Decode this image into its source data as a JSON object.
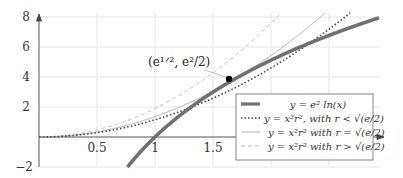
{
  "chart_data": {
    "type": "line",
    "title": "",
    "xlabel": "",
    "ylabel": "",
    "xlim": [
      0,
      2.95
    ],
    "ylim": [
      -2,
      8
    ],
    "grid": true,
    "x_ticks": [
      "0.5",
      "1",
      "1.5"
    ],
    "y_ticks": [
      "-2",
      "2",
      "4",
      "6",
      "8"
    ],
    "legend_position": "lower right",
    "series": [
      {
        "name": "y = e^2 ln(x)",
        "style": "thick solid",
        "color": "#707070",
        "formula": "e^2*ln(x)"
      },
      {
        "name": "y = x^2 r^2, with r < sqrt(e/2)",
        "style": "dotted",
        "color": "#444444",
        "r_squared": 1.15
      },
      {
        "name": "y = x^2 r^2 with r = sqrt(e/2)",
        "style": "thin solid",
        "color": "#9a9a9a",
        "r_squared": 1.3591
      },
      {
        "name": "y = x^2 r^2 with r > sqrt(e/2)",
        "style": "dashed",
        "color": "#a8a8a8",
        "r_squared": 1.9
      }
    ],
    "annotations": [
      {
        "text": "(e^{1/2}, e^2/2)",
        "x": 1.6487,
        "y": 3.6945,
        "marker": "filled-circle"
      }
    ]
  },
  "labels": {
    "x_ticks": [
      "0.5",
      "1",
      "1.5"
    ],
    "y_ticks": [
      "8",
      "6",
      "4",
      "2",
      "−2"
    ],
    "point_label": "(e¹ᐟ², e²/2)",
    "legend": [
      "y = e² ln(x)",
      "y = x²r², with r < √(e/2)",
      "y = x²r² with r = √(e/2)",
      "y = x²r² with r > √(e/2)"
    ]
  }
}
